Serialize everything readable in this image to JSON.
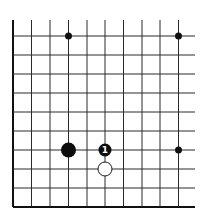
{
  "diagram": {
    "type": "go-board-fragment",
    "grid": {
      "columns_x": [
        13,
        31.5,
        50,
        68.5,
        87,
        105,
        123.5,
        142,
        160,
        178.5
      ],
      "rows_y": [
        36,
        55,
        74,
        93,
        112,
        131,
        150,
        169,
        188,
        207
      ],
      "vertical_line_top": 20,
      "horizontal_line_right": 195,
      "edges": [
        "left",
        "bottom"
      ]
    },
    "star_points": [
      {
        "col": 3,
        "row": 0
      },
      {
        "col": 9,
        "row": 0
      },
      {
        "col": 9,
        "row": 6
      }
    ],
    "stones": [
      {
        "color": "black",
        "col": 3,
        "row": 6,
        "label": "",
        "radius": 7.5
      },
      {
        "color": "black",
        "col": 5,
        "row": 6,
        "label": "1",
        "radius": 6.5
      },
      {
        "color": "white",
        "col": 5,
        "row": 7,
        "label": "",
        "radius": 7
      }
    ],
    "colors": {
      "line": "#2a2a2a",
      "black_stone": "#0d0d0d",
      "white_stone": "#ffffff"
    }
  }
}
